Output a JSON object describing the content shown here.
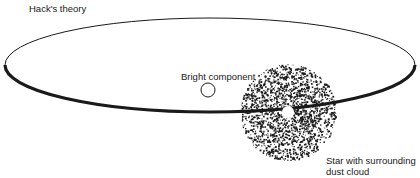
{
  "diagram": {
    "title": "Hack's theory",
    "labels": {
      "bright_component": "Bright component",
      "star_with_dust_line1": "Star with surrounding",
      "star_with_dust_line2": "dust cloud"
    },
    "elements": [
      {
        "id": "orbit",
        "kind": "ellipse",
        "meaning": "orbital path"
      },
      {
        "id": "bright-component",
        "kind": "open circle",
        "meaning": "bright component star"
      },
      {
        "id": "dust-cloud",
        "kind": "stippled disc",
        "meaning": "surrounding dust cloud"
      },
      {
        "id": "central-star",
        "kind": "white dot",
        "meaning": "star inside dust cloud"
      }
    ],
    "colors": {
      "ink": "#1a1a1a",
      "background": "#ffffff"
    }
  }
}
